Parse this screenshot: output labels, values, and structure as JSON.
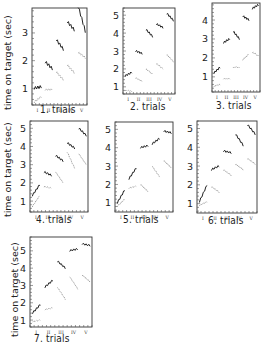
{
  "figure": {
    "ylabel": "time on target (sec)",
    "roman_ticks": [
      "I",
      "II",
      "III",
      "IV",
      "V"
    ]
  },
  "chart_data": [
    {
      "type": "line",
      "title": "1. trials",
      "ylabel": "time on target (sec)",
      "ylim": [
        0.4,
        3.9
      ],
      "yticks": [
        1,
        2,
        3
      ],
      "xlabel": "trials",
      "x": [
        "I",
        "II",
        "III",
        "IV",
        "V"
      ],
      "series": [
        {
          "name": "upper",
          "style": "solid",
          "segments": [
            [
              1.0,
              1.05
            ],
            [
              1.95,
              1.7
            ],
            [
              2.75,
              2.4
            ],
            [
              3.4,
              3.1
            ],
            [
              3.95,
              3.05
            ]
          ]
        },
        {
          "name": "lower",
          "style": "dotted",
          "segments": [
            [
              0.5,
              0.7
            ],
            [
              0.95,
              0.95
            ],
            [
              1.6,
              1.3
            ],
            [
              1.85,
              1.55
            ],
            [
              2.3,
              2.1
            ]
          ]
        }
      ],
      "grid": false
    },
    {
      "type": "line",
      "title": "2. trials",
      "ylabel": "",
      "ylim": [
        0.6,
        5.4
      ],
      "yticks": [
        1,
        2,
        3,
        4,
        5
      ],
      "x": [
        "I",
        "II",
        "III",
        "IV",
        "V"
      ],
      "series": [
        {
          "name": "upper",
          "style": "solid",
          "segments": [
            [
              1.6,
              1.8
            ],
            [
              3.0,
              2.85
            ],
            [
              4.2,
              3.8
            ],
            [
              4.5,
              4.3
            ],
            [
              5.1,
              4.7
            ]
          ]
        },
        {
          "name": "lower",
          "style": "dotted",
          "segments": [
            [
              0.8,
              0.75
            ],
            [
              1.5,
              1.3
            ],
            [
              2.0,
              1.7
            ],
            [
              2.3,
              2.0
            ],
            [
              2.8,
              2.4
            ]
          ]
        }
      ],
      "grid": false
    },
    {
      "type": "line",
      "title": "3. trials",
      "ylabel": "",
      "ylim": [
        0.2,
        4.9
      ],
      "yticks": [
        1,
        2,
        3,
        4
      ],
      "x": [
        "I",
        "II",
        "III",
        "IV",
        "V"
      ],
      "series": [
        {
          "name": "upper",
          "style": "solid",
          "segments": [
            [
              1.2,
              1.5
            ],
            [
              2.8,
              3.0
            ],
            [
              3.4,
              3.0
            ],
            [
              4.2,
              4.0
            ],
            [
              4.6,
              4.8
            ]
          ]
        },
        {
          "name": "lower",
          "style": "dotted",
          "segments": [
            [
              0.5,
              0.6
            ],
            [
              0.9,
              0.9
            ],
            [
              1.5,
              1.5
            ],
            [
              1.9,
              2.2
            ],
            [
              2.3,
              2.1
            ]
          ]
        }
      ],
      "grid": false
    },
    {
      "type": "line",
      "title": "4. trials",
      "ylabel": "time on target (sec)",
      "ylim": [
        0.4,
        5.4
      ],
      "yticks": [
        1,
        2,
        3,
        4,
        5
      ],
      "x": [
        "I",
        "II",
        "III",
        "IV",
        "V"
      ],
      "series": [
        {
          "name": "upper",
          "style": "solid",
          "segments": [
            [
              1.3,
              1.9
            ],
            [
              2.6,
              2.4
            ],
            [
              3.5,
              3.2
            ],
            [
              4.2,
              3.9
            ],
            [
              5.0,
              4.6
            ]
          ]
        },
        {
          "name": "lower",
          "style": "dotted",
          "segments": [
            [
              0.7,
              1.3
            ],
            [
              1.8,
              1.7
            ],
            [
              2.6,
              2.0
            ],
            [
              3.7,
              2.8
            ],
            [
              3.6,
              3.0
            ]
          ]
        }
      ],
      "grid": false
    },
    {
      "type": "line",
      "title": "5. trials",
      "ylabel": "",
      "ylim": [
        0.5,
        5.4
      ],
      "yticks": [
        1,
        2,
        3,
        4,
        5
      ],
      "x": [
        "I",
        "II",
        "III",
        "IV",
        "V"
      ],
      "series": [
        {
          "name": "upper",
          "style": "solid",
          "segments": [
            [
              1.0,
              1.7
            ],
            [
              2.3,
              2.9
            ],
            [
              4.0,
              4.1
            ],
            [
              4.2,
              4.5
            ],
            [
              4.9,
              4.8
            ]
          ]
        },
        {
          "name": "lower",
          "style": "dotted",
          "segments": [
            [
              0.8,
              1.2
            ],
            [
              1.8,
              1.9
            ],
            [
              2.0,
              1.6
            ],
            [
              3.0,
              2.4
            ],
            [
              3.3,
              2.9
            ]
          ]
        }
      ],
      "grid": false
    },
    {
      "type": "line",
      "title": "6. trials",
      "ylabel": "",
      "ylim": [
        0.5,
        5.4
      ],
      "yticks": [
        1,
        2,
        3,
        4,
        5
      ],
      "x": [
        "I",
        "II",
        "III",
        "IV",
        "V"
      ],
      "series": [
        {
          "name": "upper",
          "style": "solid",
          "segments": [
            [
              1.1,
              2.0
            ],
            [
              2.8,
              3.0
            ],
            [
              3.8,
              3.7
            ],
            [
              4.7,
              4.1
            ],
            [
              5.2,
              4.7
            ]
          ]
        },
        {
          "name": "lower",
          "style": "dotted",
          "segments": [
            [
              0.9,
              1.1
            ],
            [
              1.9,
              1.6
            ],
            [
              2.8,
              2.5
            ],
            [
              3.1,
              2.8
            ],
            [
              3.4,
              3.1
            ]
          ]
        }
      ],
      "grid": false
    },
    {
      "type": "line",
      "title": "7. trials",
      "ylabel": "time on target (sec)",
      "ylim": [
        0.6,
        5.8
      ],
      "yticks": [
        1,
        2,
        3,
        4,
        5
      ],
      "x": [
        "I",
        "II",
        "III",
        "IV",
        "V"
      ],
      "series": [
        {
          "name": "upper",
          "style": "solid",
          "segments": [
            [
              1.4,
              1.9
            ],
            [
              2.9,
              3.3
            ],
            [
              4.4,
              4.0
            ],
            [
              5.0,
              5.1
            ],
            [
              5.4,
              5.3
            ]
          ]
        },
        {
          "name": "lower",
          "style": "dotted",
          "segments": [
            [
              0.9,
              1.0
            ],
            [
              1.6,
              1.7
            ],
            [
              2.9,
              2.2
            ],
            [
              3.5,
              2.8
            ],
            [
              3.6,
              3.2
            ]
          ]
        }
      ],
      "grid": false
    }
  ]
}
